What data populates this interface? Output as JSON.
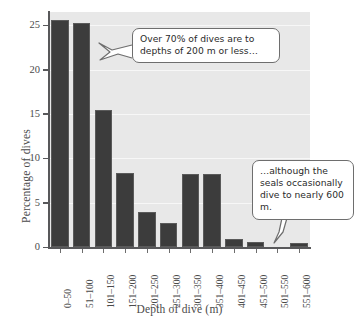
{
  "chart_data": {
    "type": "bar",
    "title": "",
    "xlabel": "Depth of dive (m)",
    "ylabel": "Percentage of dives",
    "categories": [
      "0–50",
      "51–100",
      "101–150",
      "151–200",
      "201–250",
      "251–300",
      "301–350",
      "351–400",
      "401–450",
      "451–500",
      "501–550",
      "551–600"
    ],
    "values": [
      25.6,
      25.3,
      15.4,
      8.3,
      3.9,
      2.7,
      8.2,
      8.2,
      0.9,
      0.6,
      0.0,
      0.5
    ],
    "ylim": [
      0,
      26.5
    ],
    "yticks": [
      0,
      5,
      10,
      15,
      20,
      25
    ],
    "ytick_labels": [
      "0",
      "5",
      "10",
      "15",
      "20",
      "25"
    ],
    "grid": true,
    "grid_axis": "y",
    "legend": "none",
    "bar_color": "#3c3c3c",
    "plot_background": "#e8e8e8",
    "annotations": [
      {
        "id": "callout-1",
        "text": "Over 70% of dives are to depths of 200 m or less…",
        "points_to": "101–150"
      },
      {
        "id": "callout-2",
        "text": "…although the seals occasionally dive to nearly 600 m.",
        "points_to": "551–600"
      }
    ]
  },
  "figure": {
    "y_axis_title": "Percentage of dives",
    "x_axis_title": "Depth of dive (m)"
  },
  "callouts": {
    "first": "Over 70% of dives are to depths of 200 m or less…",
    "second": "…although the seals occasionally dive to nearly 600 m."
  }
}
